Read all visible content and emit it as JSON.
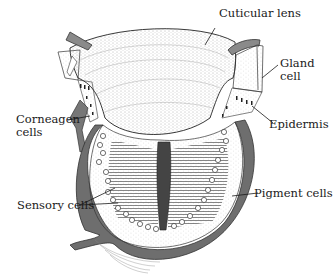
{
  "figure": {
    "labels": {
      "cuticular_lens": "Cuticular lens",
      "gland_cell_line1": "Gland",
      "gland_cell_line2": "cell",
      "corneagen_line1": "Corneagen",
      "corneagen_line2": "cells",
      "epidermis": "Epidermis",
      "sensory_cells": "Sensory cells",
      "pigment_cells": "Pigment cells"
    },
    "colors": {
      "ink": "#1a1a1a",
      "stipple": "#555555",
      "pigment_band": "#6e6e6e",
      "background": "#ffffff"
    }
  }
}
